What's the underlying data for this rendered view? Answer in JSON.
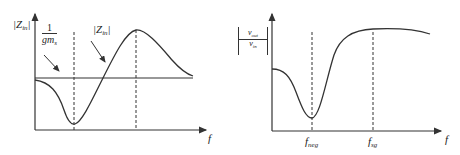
{
  "left_plot": {
    "y_axis_label": {
      "base": "|Z",
      "sub": "in",
      "close": "|"
    },
    "x_axis_label": "f",
    "ref_line_label": {
      "numerator": "1",
      "denominator_base": "gm",
      "denominator_sub": "s"
    },
    "curve_label": {
      "base": "|Z",
      "sub": "in",
      "close": "|"
    },
    "colors": {
      "line": "#333333",
      "background": "#ffffff"
    }
  },
  "right_plot": {
    "y_axis_label": {
      "numerator": "v_out",
      "num_base": "v",
      "num_sub": "out",
      "den_base": "v",
      "den_sub": "in"
    },
    "x_axis_label": "f",
    "x_ticks": [
      {
        "base": "f",
        "sub": "neg"
      },
      {
        "base": "f",
        "sub": "sg"
      }
    ]
  }
}
